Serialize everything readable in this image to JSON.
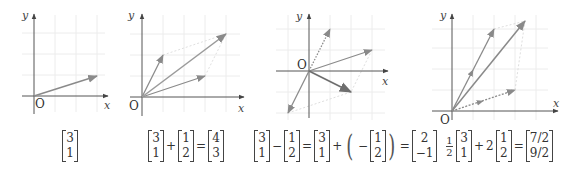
{
  "style": {
    "axis_color": "#555555",
    "grid_color": "#ececec",
    "vector_color": "#8a8a8a",
    "result_color": "#7a7a7a",
    "guide_color": "#d8d8d8"
  },
  "axis_labels": {
    "x": "x",
    "y": "y",
    "origin": "O"
  },
  "diagrams": [
    {
      "id": "vector",
      "vectors": [
        {
          "name": "a",
          "components": [
            3,
            1
          ],
          "style": "solid"
        }
      ],
      "equation": {
        "matrix": [
          "3",
          "1"
        ]
      }
    },
    {
      "id": "addition",
      "vectors": [
        {
          "name": "a",
          "components": [
            3,
            1
          ],
          "style": "solid"
        },
        {
          "name": "b",
          "components": [
            1,
            2
          ],
          "style": "solid"
        },
        {
          "name": "a+b",
          "components": [
            4,
            3
          ],
          "style": "solid"
        }
      ],
      "equation": {
        "a": [
          "3",
          "1"
        ],
        "op1": "+",
        "b": [
          "1",
          "2"
        ],
        "eq": "=",
        "result": [
          "4",
          "3"
        ]
      }
    },
    {
      "id": "subtraction",
      "vectors": [
        {
          "name": "a",
          "components": [
            3,
            1
          ],
          "style": "solid"
        },
        {
          "name": "b",
          "components": [
            1,
            2
          ],
          "style": "dotted"
        },
        {
          "name": "-b",
          "components": [
            -1,
            -2
          ],
          "style": "solid"
        },
        {
          "name": "a-b",
          "components": [
            2,
            -1
          ],
          "style": "solid-bold"
        }
      ],
      "equation": {
        "a": [
          "3",
          "1"
        ],
        "op1": "−",
        "b": [
          "1",
          "2"
        ],
        "eq1": "=",
        "a2": [
          "3",
          "1"
        ],
        "op2": "+",
        "neg": "−",
        "b2": [
          "1",
          "2"
        ],
        "eq2": "=",
        "result": [
          "2",
          "−1"
        ]
      }
    },
    {
      "id": "linear-combination",
      "vectors": [
        {
          "name": "2b",
          "components": [
            2,
            4
          ],
          "style": "solid"
        },
        {
          "name": "a/2",
          "components": [
            1.5,
            0.5
          ],
          "style": "dotted"
        },
        {
          "name": "a/2+2b",
          "components": [
            3.5,
            4.5
          ],
          "style": "solid"
        }
      ],
      "equation": {
        "coef1_num": "1",
        "coef1_den": "2",
        "a": [
          "3",
          "1"
        ],
        "op1": "+",
        "coef2": "2",
        "b": [
          "1",
          "2"
        ],
        "eq": "=",
        "result": [
          "7/2",
          "9/2"
        ]
      }
    }
  ]
}
